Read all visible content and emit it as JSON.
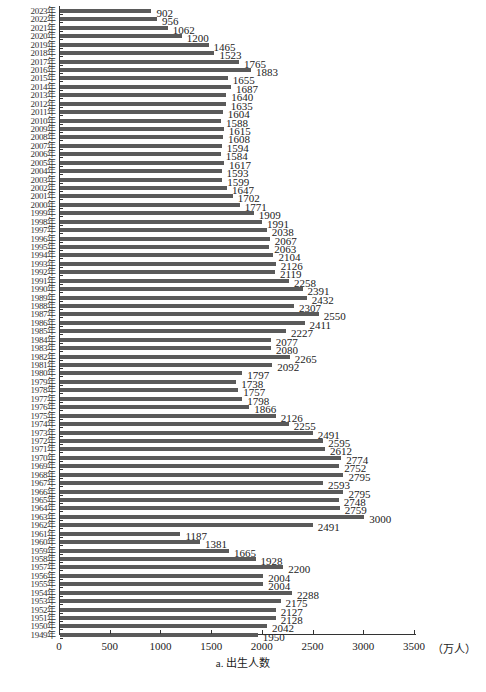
{
  "chart_data": {
    "type": "bar",
    "orientation": "horizontal",
    "title": "a. 出生人数",
    "xlabel": "a. 出生人数",
    "xunit": "（万人）",
    "ylabel": "",
    "xlim": [
      0,
      3500
    ],
    "xticks": [
      0,
      500,
      1000,
      1500,
      2000,
      2500,
      3000,
      3500
    ],
    "grid": false,
    "legend": null,
    "categories": [
      "2023年",
      "2022年",
      "2021年",
      "2020年",
      "2019年",
      "2018年",
      "2017年",
      "2016年",
      "2015年",
      "2014年",
      "2013年",
      "2012年",
      "2011年",
      "2010年",
      "2009年",
      "2008年",
      "2007年",
      "2006年",
      "2005年",
      "2004年",
      "2003年",
      "2002年",
      "2001年",
      "2000年",
      "1999年",
      "1998年",
      "1997年",
      "1996年",
      "1995年",
      "1994年",
      "1993年",
      "1992年",
      "1991年",
      "1990年",
      "1989年",
      "1988年",
      "1987年",
      "1986年",
      "1985年",
      "1984年",
      "1983年",
      "1982年",
      "1981年",
      "1980年",
      "1979年",
      "1978年",
      "1977年",
      "1976年",
      "1975年",
      "1974年",
      "1973年",
      "1972年",
      "1971年",
      "1970年",
      "1969年",
      "1968年",
      "1967年",
      "1966年",
      "1965年",
      "1964年",
      "1963年",
      "1962年",
      "1961年",
      "1960年",
      "1959年",
      "1958年",
      "1957年",
      "1956年",
      "1955年",
      "1954年",
      "1953年",
      "1952年",
      "1951年",
      "1950年",
      "1949年"
    ],
    "values": [
      902,
      956,
      1062,
      1200,
      1465,
      1523,
      1765,
      1883,
      1655,
      1687,
      1640,
      1635,
      1604,
      1588,
      1615,
      1608,
      1594,
      1584,
      1617,
      1593,
      1599,
      1647,
      1702,
      1771,
      1909,
      1991,
      2038,
      2067,
      2063,
      2104,
      2126,
      2119,
      2258,
      2391,
      2432,
      2307,
      2550,
      2411,
      2227,
      2077,
      2080,
      2265,
      2092,
      1797,
      1738,
      1757,
      1798,
      1866,
      2126,
      2255,
      2491,
      2595,
      2612,
      2774,
      2752,
      2795,
      2593,
      2795,
      2748,
      2759,
      3000,
      2491,
      1187,
      1381,
      1665,
      1928,
      2200,
      2004,
      2004,
      2288,
      2175,
      2127,
      2128,
      2042,
      1950
    ],
    "bar_color": "#5a5a5a"
  },
  "axis": {
    "x_tick_labels": [
      "0",
      "500",
      "1000",
      "1500",
      "2000",
      "2500",
      "3000",
      "3500"
    ],
    "unit_label": "（万人）",
    "caption": "a. 出生人数"
  }
}
